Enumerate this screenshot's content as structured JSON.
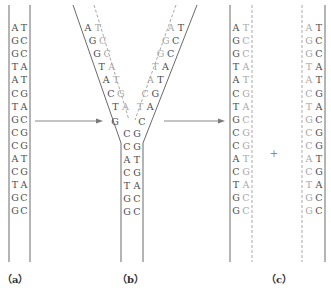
{
  "colors": {
    "old_strand": "#4a4a4a",
    "new_strand": "#a6a6a6",
    "arrow": "#7a7a7a"
  },
  "panels": [
    {
      "id": "a",
      "label": "（a）"
    },
    {
      "id": "b",
      "label": "（b）"
    },
    {
      "id": "c",
      "label": "（c）"
    }
  ],
  "plus_sign": "+",
  "sequence": {
    "left_strand": [
      "A",
      "G",
      "G",
      "T",
      "A",
      "C",
      "T",
      "G",
      "C",
      "C",
      "A",
      "C",
      "T",
      "G",
      "G"
    ],
    "right_strand": [
      "T",
      "C",
      "C",
      "A",
      "T",
      "G",
      "A",
      "C",
      "G",
      "G",
      "T",
      "G",
      "A",
      "C",
      "C"
    ]
  },
  "panel_a": {
    "description": "Parental double helix",
    "pairs": [
      [
        "A",
        "T"
      ],
      [
        "G",
        "C"
      ],
      [
        "G",
        "C"
      ],
      [
        "T",
        "A"
      ],
      [
        "A",
        "T"
      ],
      [
        "C",
        "G"
      ],
      [
        "T",
        "A"
      ],
      [
        "G",
        "C"
      ],
      [
        "C",
        "G"
      ],
      [
        "C",
        "G"
      ],
      [
        "A",
        "T"
      ],
      [
        "C",
        "G"
      ],
      [
        "T",
        "A"
      ],
      [
        "G",
        "C"
      ],
      [
        "G",
        "C"
      ]
    ]
  },
  "panel_b": {
    "description": "Replication fork",
    "left_arm": [
      [
        "A",
        "T"
      ],
      [
        "G",
        "C"
      ],
      [
        "G",
        "C"
      ],
      [
        "T",
        "A"
      ],
      [
        "A",
        "T"
      ],
      [
        "C",
        "G"
      ],
      [
        "T",
        "A"
      ]
    ],
    "right_arm": [
      [
        "A",
        "T"
      ],
      [
        "G",
        "C"
      ],
      [
        "G",
        "C"
      ],
      [
        "T",
        "A"
      ],
      [
        "A",
        "T"
      ],
      [
        "C",
        "G"
      ],
      [
        "T",
        "A"
      ]
    ],
    "fork_pair": [
      "G",
      "C"
    ],
    "stem": [
      [
        "C",
        "G"
      ],
      [
        "C",
        "G"
      ],
      [
        "A",
        "T"
      ],
      [
        "C",
        "G"
      ],
      [
        "T",
        "A"
      ],
      [
        "G",
        "C"
      ],
      [
        "G",
        "C"
      ]
    ]
  },
  "panel_c": {
    "description": "Two daughter duplexes",
    "left_duplex": [
      [
        "A",
        "T"
      ],
      [
        "G",
        "C"
      ],
      [
        "G",
        "C"
      ],
      [
        "T",
        "A"
      ],
      [
        "A",
        "T"
      ],
      [
        "C",
        "G"
      ],
      [
        "T",
        "A"
      ],
      [
        "G",
        "C"
      ],
      [
        "C",
        "G"
      ],
      [
        "C",
        "G"
      ],
      [
        "A",
        "T"
      ],
      [
        "C",
        "G"
      ],
      [
        "T",
        "A"
      ],
      [
        "G",
        "C"
      ],
      [
        "G",
        "C"
      ]
    ],
    "right_duplex": [
      [
        "A",
        "T"
      ],
      [
        "G",
        "C"
      ],
      [
        "G",
        "C"
      ],
      [
        "T",
        "A"
      ],
      [
        "A",
        "T"
      ],
      [
        "C",
        "G"
      ],
      [
        "T",
        "A"
      ],
      [
        "G",
        "C"
      ],
      [
        "C",
        "G"
      ],
      [
        "C",
        "G"
      ],
      [
        "A",
        "T"
      ],
      [
        "C",
        "G"
      ],
      [
        "T",
        "A"
      ],
      [
        "G",
        "C"
      ],
      [
        "G",
        "C"
      ]
    ]
  },
  "arrows": [
    {
      "from": "a",
      "to": "b"
    },
    {
      "from": "b",
      "to": "c"
    }
  ]
}
